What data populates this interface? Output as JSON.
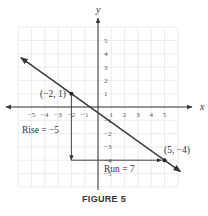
{
  "figure": {
    "caption": "FIGURE 5"
  },
  "chart_data": {
    "type": "line",
    "title": "",
    "xlabel": "x",
    "ylabel": "y",
    "xlim": [
      -6,
      6
    ],
    "ylim": [
      -6,
      6
    ],
    "grid": true,
    "x_ticks": [
      -5,
      -4,
      -3,
      -2,
      -1,
      1,
      2,
      3,
      4,
      5
    ],
    "y_ticks": [
      -5,
      -4,
      -3,
      -2,
      -1,
      1,
      2,
      3,
      4,
      5
    ],
    "line": {
      "slope": -0.7142857,
      "intercept": -0.4285714,
      "color": "#333333",
      "arrows_both_ends": true
    },
    "points": [
      {
        "x": -2,
        "y": 1,
        "label": "(−2, 1)"
      },
      {
        "x": 5,
        "y": -4,
        "label": "(5, −4)"
      }
    ],
    "annotations": [
      {
        "text": "Rise = −5",
        "type": "vertical-arrow",
        "from": [
          -2,
          1
        ],
        "to": [
          -2,
          -4
        ]
      },
      {
        "text": "Run = 7",
        "type": "horizontal-arrow",
        "from": [
          -2,
          -4
        ],
        "to": [
          5,
          -4
        ]
      }
    ]
  }
}
